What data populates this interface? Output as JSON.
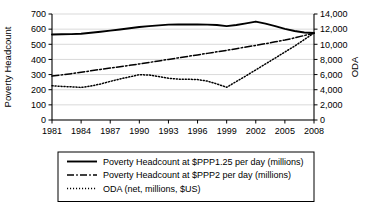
{
  "chart_data": {
    "type": "line",
    "title": "",
    "xlabel": "",
    "ylabel": "Poverty Headcount",
    "y2label": "ODA",
    "grid": true,
    "legend_position": "bottom",
    "x": [
      1981,
      1982,
      1983,
      1984,
      1985,
      1986,
      1987,
      1988,
      1989,
      1990,
      1991,
      1992,
      1993,
      1994,
      1995,
      1996,
      1997,
      1998,
      1999,
      2000,
      2001,
      2002,
      2003,
      2004,
      2005,
      2006,
      2007,
      2008
    ],
    "x_tick_labels": [
      "1981",
      "1984",
      "1987",
      "1990",
      "1993",
      "1996",
      "1999",
      "2002",
      "2005",
      "2008"
    ],
    "x_tick_values": [
      1981,
      1984,
      1987,
      1990,
      1993,
      1996,
      1999,
      2002,
      2005,
      2008
    ],
    "xlim": [
      1981,
      2008
    ],
    "ylim": [
      0,
      700
    ],
    "y_tick_labels": [
      "0",
      "100",
      "200",
      "300",
      "400",
      "500",
      "600",
      "700"
    ],
    "y_tick_values": [
      0,
      100,
      200,
      300,
      400,
      500,
      600,
      700
    ],
    "y2lim": [
      0,
      14000
    ],
    "y2_tick_labels": [
      "0",
      "2,000",
      "4,000",
      "6,000",
      "8,000",
      "10,000",
      "12,000",
      "14,000"
    ],
    "y2_tick_values": [
      0,
      2000,
      4000,
      6000,
      8000,
      10000,
      12000,
      14000
    ],
    "series": [
      {
        "name": "Poverty Headcount at $PPP1.25 per day (millions)",
        "axis": "left",
        "style": "solid",
        "color": "#000000",
        "width": 1.9,
        "values": [
          565,
          566,
          567,
          570,
          576,
          583,
          590,
          598,
          606,
          614,
          620,
          625,
          630,
          631,
          631,
          631,
          630,
          627,
          620,
          627,
          638,
          650,
          636,
          620,
          602,
          588,
          578,
          575
        ]
      },
      {
        "name": "Poverty Headcount at $PPP2 per day (millions)",
        "axis": "left",
        "style": "dashdot",
        "color": "#000000",
        "width": 1.5,
        "values": [
          290,
          298,
          306,
          315,
          325,
          334,
          343,
          352,
          361,
          370,
          380,
          390,
          400,
          410,
          420,
          430,
          440,
          450,
          460,
          471,
          482,
          493,
          504,
          516,
          528,
          542,
          558,
          573
        ]
      },
      {
        "name": "ODA (net, millions, $US)",
        "axis": "right",
        "style": "dotted",
        "color": "#000000",
        "width": 1.5,
        "values": [
          4520,
          4440,
          4380,
          4300,
          4480,
          4760,
          5100,
          5420,
          5700,
          5980,
          5940,
          5740,
          5520,
          5400,
          5380,
          5340,
          5140,
          4760,
          4320,
          5080,
          5840,
          6620,
          7400,
          8180,
          8980,
          9760,
          10620,
          11500
        ]
      }
    ]
  },
  "legend": {
    "entries": [
      {
        "label": "Poverty Headcount at $PPP1.25 per day (millions)",
        "style": "solid"
      },
      {
        "label": "Poverty Headcount at $PPP2 per day (millions)",
        "style": "dashdot"
      },
      {
        "label": "ODA (net, millions, $US)",
        "style": "dotted"
      }
    ]
  }
}
